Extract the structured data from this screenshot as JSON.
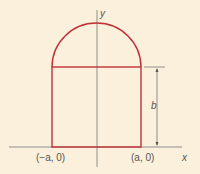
{
  "colors": {
    "background": "#fbf0dc",
    "shape": "#c0303a",
    "axis": "#777777",
    "text": "#555555"
  },
  "labels": {
    "y_axis": "y",
    "x_axis": "x",
    "left_point": "(−a, 0)",
    "right_point": "(a, 0)",
    "height": "b"
  }
}
